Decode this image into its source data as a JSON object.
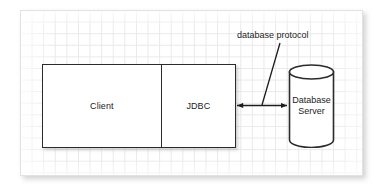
{
  "diagram": {
    "title_text": "database protocol",
    "client_box": {
      "label": "Client"
    },
    "jdbc_box": {
      "label": "JDBC"
    },
    "database": {
      "label": "Database\nServer"
    },
    "connector": {
      "name": "bidirectional-arrow",
      "leader_name": "label-leader-line"
    },
    "colors": {
      "stroke": "#2b2b2b",
      "grid": "#e9e9e9",
      "panel_border": "#e2e2e2",
      "fill": "#ffffff",
      "text": "#1c1c1c"
    }
  }
}
